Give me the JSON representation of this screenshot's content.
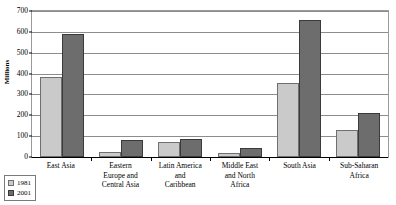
{
  "chart_data": {
    "type": "bar",
    "title": "",
    "xlabel": "",
    "ylabel": "Millions",
    "ylim": [
      0,
      700
    ],
    "yticks": [
      0,
      100,
      200,
      300,
      400,
      500,
      600,
      700
    ],
    "grid": true,
    "legend_position": "bottom-left",
    "categories": [
      "East Asia",
      "Eastern Europe and Central Asia",
      "Latin America and Caribbean",
      "Middle East and North Africa",
      "South Asia",
      "Sub-Saharan Africa"
    ],
    "category_lines": [
      [
        "East Asia"
      ],
      [
        "Eastern",
        "Europe and",
        "Central Asia"
      ],
      [
        "Latin America",
        "and",
        "Caribbean"
      ],
      [
        "Middle East",
        "and North",
        "Africa"
      ],
      [
        "South Asia"
      ],
      [
        "Sub-Saharan",
        "Africa"
      ]
    ],
    "series": [
      {
        "name": "1981",
        "color": "#cacaca",
        "values": [
          385,
          22,
          73,
          18,
          355,
          130
        ]
      },
      {
        "name": "2001",
        "color": "#6d6d6d",
        "values": [
          592,
          82,
          88,
          42,
          655,
          210
        ]
      }
    ]
  },
  "legend": {
    "items": [
      {
        "label": "1981"
      },
      {
        "label": "2001"
      }
    ]
  }
}
